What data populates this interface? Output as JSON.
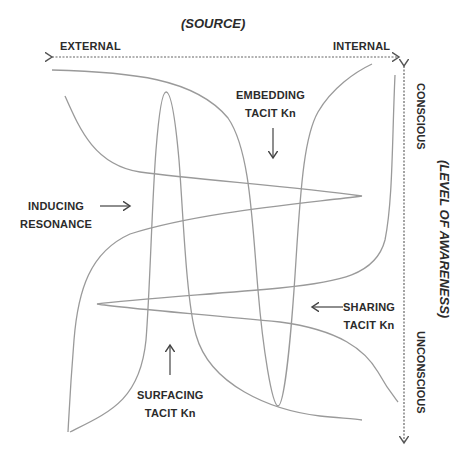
{
  "diagram": {
    "title_source": "(SOURCE)",
    "title_awareness": "(LEVEL OF AWARENESS)",
    "axis_x": {
      "left_label": "EXTERNAL",
      "right_label": "INTERNAL"
    },
    "axis_y": {
      "top_label": "CONSCIOUS",
      "bottom_label": "UNCONSCIOUS"
    },
    "labels": {
      "inducing": [
        "INDUCING",
        "RESONANCE"
      ],
      "embedding": [
        "EMBEDDING",
        "TACIT Kn"
      ],
      "sharing": [
        "SHARING",
        "TACIT Kn"
      ],
      "surfacing": [
        "SURFACING",
        "TACIT Kn"
      ]
    },
    "colors": {
      "curve": "#9a9a9a",
      "text": "#2b2b2b",
      "axis": "#555555"
    }
  }
}
